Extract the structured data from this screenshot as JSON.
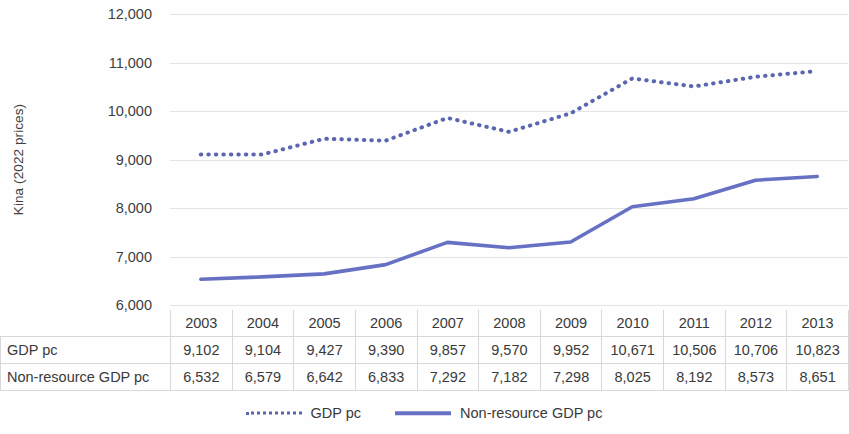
{
  "chart_data": {
    "type": "line",
    "title": "",
    "xlabel": "",
    "ylabel": "Kina (2022 prices)",
    "ylim": [
      6000,
      12000
    ],
    "ytick_step": 1000,
    "yticks": [
      "12,000",
      "11,000",
      "10,000",
      "9,000",
      "8,000",
      "7,000",
      "6,000"
    ],
    "ytick_values": [
      12000,
      11000,
      10000,
      9000,
      8000,
      7000,
      6000
    ],
    "grid": true,
    "legend_position": "bottom-center",
    "categories": [
      "2003",
      "2004",
      "2005",
      "2006",
      "2007",
      "2008",
      "2009",
      "2010",
      "2011",
      "2012",
      "2013"
    ],
    "series": [
      {
        "name": "GDP pc",
        "style": "dotted",
        "color": "#5b66b0",
        "values": [
          9102,
          9104,
          9427,
          9390,
          9857,
          9570,
          9952,
          10671,
          10506,
          10706,
          10823
        ],
        "labels": [
          "9,102",
          "9,104",
          "9,427",
          "9,390",
          "9,857",
          "9,570",
          "9,952",
          "10,671",
          "10,506",
          "10,706",
          "10,823"
        ]
      },
      {
        "name": "Non-resource GDP pc",
        "style": "solid",
        "color": "#6671c4",
        "values": [
          6532,
          6579,
          6642,
          6833,
          7292,
          7182,
          7298,
          8025,
          8192,
          8573,
          8651
        ],
        "labels": [
          "6,532",
          "6,579",
          "6,642",
          "6,833",
          "7,292",
          "7,182",
          "7,298",
          "8,025",
          "8,192",
          "8,573",
          "8,651"
        ]
      }
    ]
  },
  "axis": {
    "y_title": "Kina (2022 prices)"
  },
  "table": {
    "columns": [
      "2003",
      "2004",
      "2005",
      "2006",
      "2007",
      "2008",
      "2009",
      "2010",
      "2011",
      "2012",
      "2013"
    ],
    "rows": [
      {
        "label": "GDP pc",
        "cells": [
          "9,102",
          "9,104",
          "9,427",
          "9,390",
          "9,857",
          "9,570",
          "9,952",
          "10,671",
          "10,506",
          "10,706",
          "10,823"
        ]
      },
      {
        "label": "Non-resource GDP pc",
        "cells": [
          "6,532",
          "6,579",
          "6,642",
          "6,833",
          "7,292",
          "7,182",
          "7,298",
          "8,025",
          "8,192",
          "8,573",
          "8,651"
        ]
      }
    ]
  },
  "legend": {
    "items": [
      {
        "label": "GDP pc",
        "style": "dotted",
        "color": "#5b66b0"
      },
      {
        "label": "Non-resource GDP pc",
        "style": "solid",
        "color": "#6671c4"
      }
    ]
  }
}
